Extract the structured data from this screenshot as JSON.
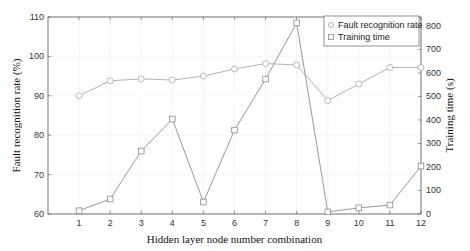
{
  "chart_data": {
    "type": "line",
    "title": "",
    "xlabel": "Hidden layer node number combination",
    "ylabel": "Fault recognition rate (%)",
    "y2label": "Training time (s)",
    "x": [
      1,
      2,
      3,
      4,
      5,
      6,
      7,
      8,
      9,
      10,
      11,
      12
    ],
    "xlim": [
      0,
      12
    ],
    "ylim": [
      60,
      110
    ],
    "y2lim": [
      0,
      838
    ],
    "yticks": [
      60,
      70,
      80,
      90,
      100,
      110
    ],
    "y2ticks": [
      0,
      100,
      200,
      300,
      400,
      500,
      600,
      700,
      800
    ],
    "grid": true,
    "legend_position": "upper right",
    "series": [
      {
        "name": "Fault recognition rate",
        "axis": "left",
        "marker": "circle",
        "color": "#a8a8a8",
        "values": [
          90.0,
          93.8,
          94.3,
          94.0,
          95.0,
          96.8,
          98.2,
          97.8,
          88.8,
          93.0,
          97.2,
          97.2
        ]
      },
      {
        "name": "Training time",
        "axis": "right",
        "marker": "square",
        "color": "#8c8c8c",
        "values": [
          14,
          64,
          268,
          404,
          51,
          357,
          574,
          813,
          9,
          26,
          38,
          204
        ]
      }
    ]
  },
  "legend": {
    "items": [
      {
        "label": "Fault recognition rate"
      },
      {
        "label": "Training time"
      }
    ]
  },
  "axes": {
    "x_label": "Hidden layer node number combination",
    "y_left_label": "Fault recognition rate (%)",
    "y_right_label": "Training time (s)"
  }
}
